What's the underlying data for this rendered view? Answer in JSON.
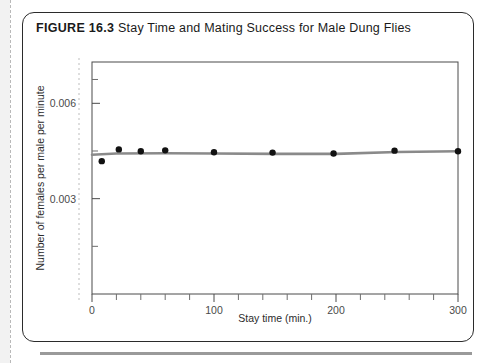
{
  "figure": {
    "number": "FIGURE 16.3",
    "title": "Stay Time and Mating Success for Male Dung Flies"
  },
  "chart_data": {
    "type": "scatter",
    "title": "Stay Time and Mating Success for Male Dung Flies",
    "xlabel": "Stay time (min.)",
    "ylabel": "Number of females per male per minute",
    "xlim": [
      0,
      300
    ],
    "ylim": [
      0,
      0.0073
    ],
    "xticks": [
      0,
      100,
      200,
      300
    ],
    "xtick_labels": [
      "0",
      "100",
      "200",
      "300"
    ],
    "xminor_ticks": [
      20,
      40,
      60,
      80,
      120,
      140,
      160,
      180,
      220,
      240,
      260,
      280
    ],
    "yticks": [
      0.003,
      0.006
    ],
    "ytick_labels": [
      "0.003",
      "0.006"
    ],
    "yminor_ticks": [
      0.0015,
      0.0045,
      0.00675
    ],
    "grid": false,
    "legend": "none",
    "marker_color": "#111111",
    "line_color": "#8a8a8a",
    "series": [
      {
        "name": "observed",
        "kind": "points",
        "x": [
          8,
          22,
          40,
          60,
          100,
          148,
          198,
          248,
          300
        ],
        "y": [
          0.00418,
          0.00455,
          0.00449,
          0.00452,
          0.00446,
          0.00445,
          0.00442,
          0.00451,
          0.00449
        ]
      },
      {
        "name": "fitted curve",
        "kind": "line",
        "x": [
          0,
          20,
          60,
          100,
          150,
          200,
          250,
          300
        ],
        "y": [
          0.00438,
          0.00442,
          0.00443,
          0.00442,
          0.00441,
          0.00441,
          0.00447,
          0.00449
        ]
      }
    ]
  }
}
